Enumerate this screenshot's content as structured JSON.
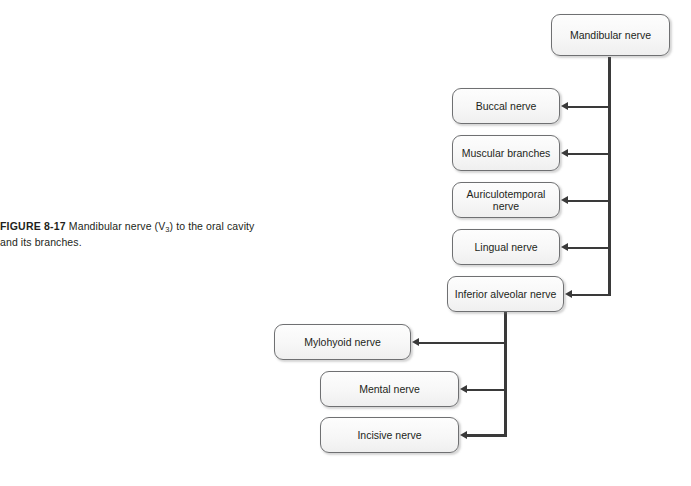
{
  "figure": {
    "label": "FIGURE 8-17",
    "caption_part1": "Mandibular nerve (V",
    "caption_subscript": "3",
    "caption_part2": ") to the oral cavity and its branches."
  },
  "diagram": {
    "type": "flowchart",
    "orientation": "right-to-left branching tree",
    "root": "Mandibular nerve",
    "nodes": [
      {
        "id": "mandibular",
        "label": "Mandibular nerve"
      },
      {
        "id": "buccal",
        "label": "Buccal nerve"
      },
      {
        "id": "muscular",
        "label": "Muscular branches"
      },
      {
        "id": "auriculotemporal",
        "label": "Auriculotemporal nerve"
      },
      {
        "id": "lingual",
        "label": "Lingual nerve"
      },
      {
        "id": "inferior_alveolar",
        "label": "Inferior alveolar nerve"
      },
      {
        "id": "mylohyoid",
        "label": "Mylohyoid nerve"
      },
      {
        "id": "mental",
        "label": "Mental nerve"
      },
      {
        "id": "incisive",
        "label": "Incisive nerve"
      }
    ],
    "edges": [
      {
        "from": "mandibular",
        "to": "buccal"
      },
      {
        "from": "mandibular",
        "to": "muscular"
      },
      {
        "from": "mandibular",
        "to": "auriculotemporal"
      },
      {
        "from": "mandibular",
        "to": "lingual"
      },
      {
        "from": "mandibular",
        "to": "inferior_alveolar"
      },
      {
        "from": "inferior_alveolar",
        "to": "mylohyoid"
      },
      {
        "from": "inferior_alveolar",
        "to": "mental"
      },
      {
        "from": "inferior_alveolar",
        "to": "incisive"
      }
    ],
    "colors": {
      "line": "#3a3a3a",
      "box_border": "#6f7072",
      "box_fill": "#f7f7f7",
      "text": "#231f20",
      "background": "#ffffff"
    }
  }
}
